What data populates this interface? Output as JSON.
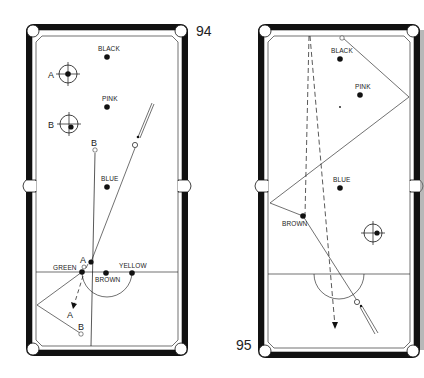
{
  "diagrams": [
    {
      "number": "94",
      "balls": {
        "black": "BLACK",
        "pink": "PINK",
        "blue": "BLUE",
        "green": "GREEN",
        "brown": "BROWN",
        "yellow": "YELLOW"
      },
      "cue_ball_markers": [
        {
          "label": "A",
          "note": "central striking point"
        },
        {
          "label": "B",
          "note": "low left striking point"
        }
      ],
      "path_labels": {
        "a_top": "A",
        "a_bottom": "A",
        "b_top": "B",
        "b_bottom": "B"
      }
    },
    {
      "number": "95",
      "balls": {
        "black": "BLACK",
        "pink": "PINK",
        "blue": "BLUE",
        "brown": "BROWN"
      },
      "cue_ball_markers": [
        {
          "label": "",
          "note": "right-of-centre striking point"
        }
      ]
    }
  ],
  "colors": {
    "ink": "#111111",
    "cloth": "#ffffff",
    "rail": "#111111"
  }
}
